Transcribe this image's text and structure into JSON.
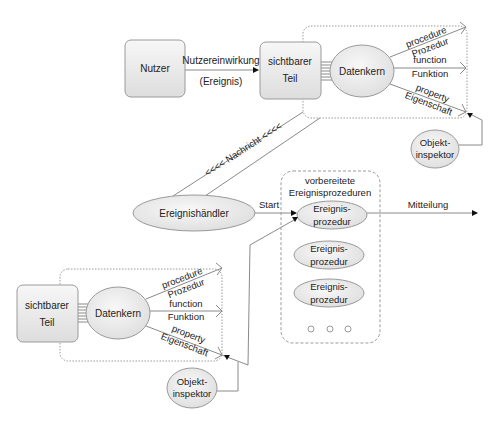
{
  "top_module": {
    "user_box": "Nutzer",
    "user_action_label": "Nutzereinwirkung",
    "user_action_sub": "(Ereignis)",
    "visible_part": [
      "sichtbarer",
      "Teil"
    ],
    "data_core": "Datenkern",
    "members": [
      {
        "en": "procedure",
        "de": "Prozedur"
      },
      {
        "en": "function",
        "de": "Funktion"
      },
      {
        "en": "property",
        "de": "Eigenschaft"
      }
    ],
    "object_inspector": [
      "Objekt-",
      "inspektor"
    ]
  },
  "message_label": "<<<< Nachricht <<<<",
  "event_handler": "Ereignishändler",
  "start_label": "Start",
  "prepared_procedures": {
    "title": [
      "vorbereitete",
      "Ereignisprozeduren"
    ],
    "items": [
      [
        "Ereignis-",
        "prozedur"
      ],
      [
        "Ereignis-",
        "prozedur"
      ],
      [
        "Ereignis-",
        "prozedur"
      ]
    ],
    "more_indicator": "○ ○ ○"
  },
  "output_label": "Mitteilung",
  "bottom_module": {
    "visible_part": [
      "sichtbarer",
      "Teil"
    ],
    "data_core": "Datenkern",
    "members": [
      {
        "en": "procedure",
        "de": "Prozedur"
      },
      {
        "en": "function",
        "de": "Funktion"
      },
      {
        "en": "property",
        "de": "Eigenschaft"
      }
    ],
    "object_inspector": [
      "Objekt-",
      "inspektor"
    ]
  },
  "colors": {
    "stroke": "#8a8a8a",
    "fill_light": "#f4f4f4",
    "fill_dark": "#dcdcdc",
    "text": "#222222"
  }
}
